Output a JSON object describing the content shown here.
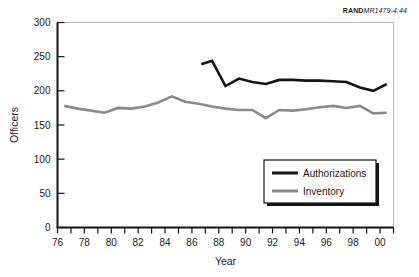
{
  "source_id": {
    "bold_part": "RAND",
    "italic_part": "MR1479-4.44"
  },
  "chart_data": {
    "type": "line",
    "title": "",
    "xlabel": "Year",
    "ylabel": "Officers",
    "xlim": [
      76,
      101
    ],
    "ylim": [
      0,
      300
    ],
    "grid": false,
    "legend_position": "bottom-right",
    "x_tick_labels": [
      "76",
      "78",
      "80",
      "82",
      "84",
      "86",
      "88",
      "90",
      "92",
      "94",
      "96",
      "98",
      "00"
    ],
    "x_tick_values": [
      76,
      78,
      80,
      82,
      84,
      86,
      88,
      90,
      92,
      94,
      96,
      98,
      100
    ],
    "x_minor_ticks": [
      76,
      77,
      78,
      79,
      80,
      81,
      82,
      83,
      84,
      85,
      86,
      87,
      88,
      89,
      90,
      91,
      92,
      93,
      94,
      95,
      96,
      97,
      98,
      99,
      100,
      101
    ],
    "y_tick_labels": [
      "0",
      "50",
      "100",
      "150",
      "200",
      "250",
      "300"
    ],
    "y_tick_values": [
      0,
      50,
      100,
      150,
      200,
      250,
      300
    ],
    "series": [
      {
        "name": "Authorizations",
        "color": "#141414",
        "width": 2.6,
        "x": [
          86.7,
          87.5,
          88.5,
          89.5,
          90.5,
          91.5,
          92.5,
          93.5,
          94.5,
          95.5,
          96.5,
          97.5,
          98.5,
          99.5,
          100.5
        ],
        "values": [
          239,
          244,
          207,
          218,
          213,
          210,
          216,
          216,
          215,
          215,
          214,
          213,
          205,
          200,
          210
        ]
      },
      {
        "name": "Inventory",
        "color": "#8a8a8a",
        "width": 2.6,
        "x": [
          76.5,
          77.5,
          78.5,
          79.5,
          80.5,
          81.5,
          82.5,
          83.5,
          84.5,
          85.5,
          86.5,
          87.5,
          88.5,
          89.5,
          90.5,
          91.5,
          92.5,
          93.5,
          94.5,
          95.5,
          96.5,
          97.5,
          98.5,
          99.5,
          100.5
        ],
        "values": [
          178,
          174,
          171,
          168,
          175,
          174,
          177,
          183,
          192,
          184,
          181,
          177,
          174,
          172,
          172,
          160,
          172,
          171,
          173,
          176,
          178,
          175,
          178,
          167,
          168
        ]
      }
    ]
  },
  "legend": {
    "entries": [
      {
        "label": "Authorizations",
        "color": "#141414"
      },
      {
        "label": "Inventory",
        "color": "#8a8a8a"
      }
    ]
  }
}
